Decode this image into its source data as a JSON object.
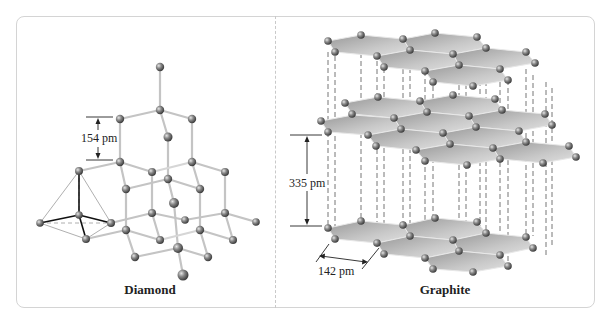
{
  "figure": {
    "panels": [
      {
        "id": "diamond",
        "caption": "Diamond",
        "bond_length_label": "154 pm"
      },
      {
        "id": "graphite",
        "caption": "Graphite",
        "interlayer_spacing_label": "335 pm",
        "bond_length_label": "142 pm"
      }
    ],
    "colors": {
      "atom": "#7d7d7d",
      "bond": "#c4c4c4",
      "sheet": "#b9b9b9",
      "panel_border": "#d4d4d4"
    }
  }
}
